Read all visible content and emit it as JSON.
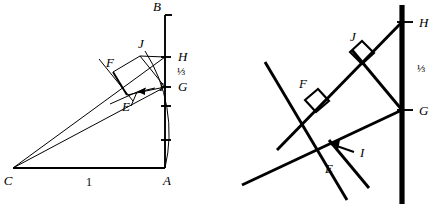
{
  "figure": {
    "panels": [
      {
        "id": "left",
        "name": "overview-diagram",
        "description": "Right triangle C-A-B with arc from A, two rays from C, quadrilateral EFJG",
        "base_length_label": "1",
        "fraction_label": "⅓",
        "points": [
          {
            "label": "B",
            "name": "point-b"
          },
          {
            "label": "H",
            "name": "point-h"
          },
          {
            "label": "G",
            "name": "point-g"
          },
          {
            "label": "J",
            "name": "point-j"
          },
          {
            "label": "F",
            "name": "point-f"
          },
          {
            "label": "I",
            "name": "point-i"
          },
          {
            "label": "E",
            "name": "point-e"
          },
          {
            "label": "C",
            "name": "point-c"
          },
          {
            "label": "A",
            "name": "point-a"
          }
        ]
      },
      {
        "id": "right",
        "name": "detail-diagram",
        "description": "Magnified detail of the construction showing right angles at F and J",
        "fraction_label": "⅓",
        "points": [
          {
            "label": "H",
            "name": "point-h"
          },
          {
            "label": "J",
            "name": "point-j"
          },
          {
            "label": "F",
            "name": "point-f"
          },
          {
            "label": "G",
            "name": "point-g"
          },
          {
            "label": "I",
            "name": "point-i"
          },
          {
            "label": "E",
            "name": "point-e"
          }
        ]
      }
    ],
    "colors": {
      "ink": "#000000",
      "background": "#ffffff"
    }
  }
}
